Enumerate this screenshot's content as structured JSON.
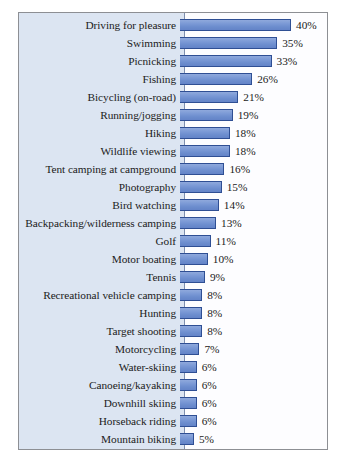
{
  "chart_data": {
    "type": "bar",
    "orientation": "horizontal",
    "title": "",
    "xlabel": "",
    "ylabel": "",
    "xlim": [
      0,
      40
    ],
    "grid": false,
    "legend": null,
    "value_suffix": "%",
    "categories": [
      "Driving for pleasure",
      "Swimming",
      "Picnicking",
      "Fishing",
      "Bicycling (on-road)",
      "Running/jogging",
      "Hiking",
      "Wildlife viewing",
      "Tent camping at campground",
      "Photography",
      "Bird watching",
      "Backpacking/wilderness camping",
      "Golf",
      "Motor boating",
      "Tennis",
      "Recreational vehicle camping",
      "Hunting",
      "Target shooting",
      "Motorcycling",
      "Water-skiing",
      "Canoeing/kayaking",
      "Downhill skiing",
      "Horseback riding",
      "Mountain biking",
      "Off-road vehicle driving"
    ],
    "values": [
      40,
      35,
      33,
      26,
      21,
      19,
      18,
      18,
      16,
      15,
      14,
      13,
      11,
      10,
      9,
      8,
      8,
      8,
      7,
      6,
      6,
      6,
      6,
      5,
      5
    ],
    "value_labels": [
      "40%",
      "35%",
      "33%",
      "26%",
      "21%",
      "19%",
      "18%",
      "18%",
      "16%",
      "15%",
      "14%",
      "13%",
      "11%",
      "10%",
      "9%",
      "8%",
      "8%",
      "8%",
      "7%",
      "6%",
      "6%",
      "6%",
      "6%",
      "5%",
      "5%"
    ],
    "colors": {
      "bar_fill": "#6f90cf",
      "bar_border": "#2f4f94",
      "label_panel": "#dce5f2",
      "plot_background": "#fdfdff",
      "frame_border": "#8d8f94",
      "text": "#1b1b21",
      "axis_line": "#7e8fae"
    }
  }
}
